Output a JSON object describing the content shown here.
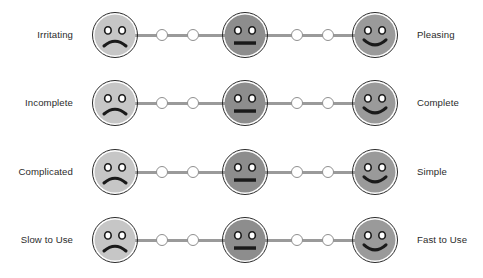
{
  "figure": {
    "name": "ux-semantic-differential-scale",
    "background_color": "#ffffff"
  },
  "colors": {
    "face_negative_fill": "#c6c6c6",
    "face_neutral_fill": "#8d8d8d",
    "face_positive_fill": "#9a9a9a",
    "face_outline": "#2a2a2a",
    "feature_color": "#1a1a1a",
    "track_line": "#9a9a9a",
    "dot_fill": "#ffffff",
    "dot_outline": "#8f8f8f",
    "label_text": "#2b2b2b"
  },
  "scale": {
    "points_per_row": 7,
    "face_positions": [
      1,
      4,
      7
    ],
    "dot_positions": [
      2,
      3,
      5,
      6
    ],
    "face_icons": [
      "sad-face-icon",
      "neutral-face-icon",
      "happy-face-icon"
    ]
  },
  "rows": [
    {
      "id": "row-irritating-pleasing",
      "left_label": "Irritating",
      "right_label": "Pleasing"
    },
    {
      "id": "row-incomplete-complete",
      "left_label": "Incomplete",
      "right_label": "Complete"
    },
    {
      "id": "row-complicated-simple",
      "left_label": "Complicated",
      "right_label": "Simple"
    },
    {
      "id": "row-slow-fast",
      "left_label": "Slow to Use",
      "right_label": "Fast to Use"
    }
  ]
}
